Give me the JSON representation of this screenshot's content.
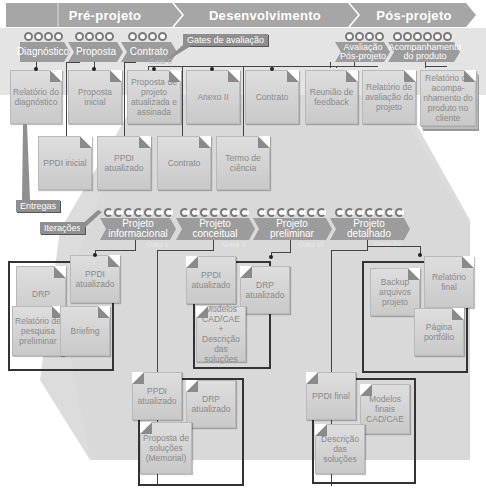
{
  "phases": [
    {
      "label": "Pré-projeto"
    },
    {
      "label": "Desenvolvimento"
    },
    {
      "label": "Pós-projeto"
    }
  ],
  "pre_stages": [
    {
      "label": "Diagnóstico"
    },
    {
      "label": "Proposta"
    },
    {
      "label": "Contrato"
    }
  ],
  "post_stages": [
    {
      "label": "Avaliação Pós-projeto"
    },
    {
      "label": "Acompanhamento do produto"
    }
  ],
  "annotations": {
    "gates": "Gates de avaliação",
    "gate_0": "Gate 0",
    "deliverables": "Entregas",
    "iterations": "Iterações"
  },
  "pre_docs": {
    "relatorio_diagnostico": "Relatório do diagnóstico",
    "proposta_inicial": "Proposta inicial",
    "proposta_atualizada": "Proposta de projeto atualizada e assinada",
    "anexo_ii": "Anexo II",
    "contrato_top": "Contrato",
    "ppdi_inicial": "PPDI inicial",
    "ppdi_atualizado": "PPDI atualizado",
    "contrato_bottom": "Contrato",
    "termo_ciencia": "Termo de ciência"
  },
  "post_docs": {
    "reuniao_feedback": "Reunião de feedback",
    "relatorio_avaliacao": "Relatório de avaliação do projeto",
    "relatorio_acompanhamento": "Relatório de acompa-nhamento do produto no cliente"
  },
  "dev_stages": [
    {
      "label": "Projeto informacional",
      "gate": "Gate I"
    },
    {
      "label": "Projeto conceitual",
      "gate": "Gate II"
    },
    {
      "label": "Projeto preliminar",
      "gate": "Gate III"
    },
    {
      "label": "Projeto detalhado",
      "gate": "Gate IV"
    }
  ],
  "informacional_docs": {
    "ppdi": "PPDI atualizado",
    "drp": "DRP",
    "relatorio_pesquisa": "Relatório de pesquisa preliminar",
    "briefing": "Briefing"
  },
  "conceitual_docs": {
    "ppdi": "PPDI atualizado",
    "drp": "DRP atualizado",
    "modelos": "Modelos CAD/CAE + Descrição das soluções"
  },
  "preliminar_docs": {
    "ppdi": "PPDI atualizado",
    "drp": "DRP atualizado",
    "proposta": "Proposta de soluções (Memorial)"
  },
  "detalhado_top_docs": {
    "backup": "Backup arquivos projeto",
    "relatorio_final": "Relatório final",
    "pagina": "Página portfólio"
  },
  "detalhado_bottom_docs": {
    "ppdi": "PPDI final",
    "modelos": "Modelos finais CAD/CAE",
    "descricao": "Descrição das soluções"
  },
  "colors": {
    "phase_arrow": "#a3a3a3",
    "stage_arrow": "#9a9a9a",
    "funnel": "#d9d9d9",
    "doc_fill": "#d4d4d4",
    "box_border": "#333333"
  }
}
